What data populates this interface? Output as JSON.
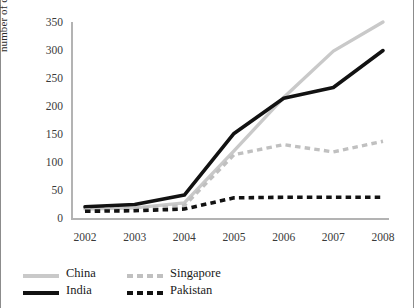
{
  "chart_data": {
    "type": "line",
    "title": "",
    "xlabel": "",
    "ylabel": "number of clinical trials registered",
    "categories": [
      "2002",
      "2003",
      "2004",
      "2005",
      "2006",
      "2007",
      "2008"
    ],
    "x": [
      2002,
      2003,
      2004,
      2005,
      2006,
      2007,
      2008
    ],
    "xlim": [
      2002,
      2008
    ],
    "ylim": [
      0,
      350
    ],
    "yticks": [
      0,
      50,
      100,
      150,
      200,
      250,
      300,
      350
    ],
    "grid": false,
    "legend_position": "bottom-left",
    "series": [
      {
        "name": "China",
        "color": "#c9c9c9",
        "style": "solid",
        "values": [
          16,
          18,
          27,
          120,
          215,
          298,
          350
        ]
      },
      {
        "name": "India",
        "color": "#121212",
        "style": "solid",
        "values": [
          20,
          24,
          41,
          151,
          214,
          233,
          299
        ]
      },
      {
        "name": "Singapore",
        "color": "#c0c0c0",
        "style": "dashed",
        "values": [
          14,
          17,
          22,
          113,
          131,
          118,
          137
        ]
      },
      {
        "name": "Pakistan",
        "color": "#121212",
        "style": "dashed",
        "values": [
          12,
          13,
          16,
          36,
          37,
          37,
          37
        ]
      }
    ]
  },
  "legend": {
    "items": [
      {
        "label": "China",
        "swatch": "solid-light-line-swatch"
      },
      {
        "label": "Singapore",
        "swatch": "dashed-light-line-swatch"
      },
      {
        "label": "India",
        "swatch": "solid-dark-line-swatch"
      },
      {
        "label": "Pakistan",
        "swatch": "dashed-dark-line-swatch"
      }
    ]
  }
}
